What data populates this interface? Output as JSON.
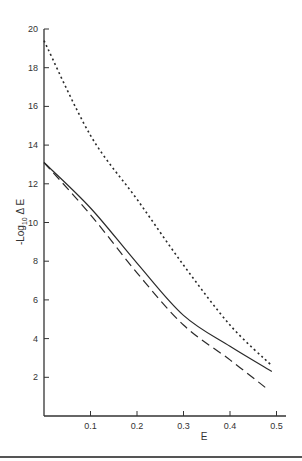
{
  "chart_data": {
    "type": "line",
    "title": "",
    "xlabel": "E",
    "ylabel": "-Log10 ΔE",
    "ylabel_parts": {
      "prefix": "-Log",
      "subscript": "10",
      "suffix": " Δ E"
    },
    "xlim": [
      0,
      0.5
    ],
    "ylim": [
      0,
      20
    ],
    "grid": false,
    "legend": null,
    "x_ticks": [
      0.1,
      0.2,
      0.3,
      0.4,
      0.5
    ],
    "x_tick_labels": [
      "0.1",
      "0.2",
      "0.3",
      "0.4",
      "0.5"
    ],
    "y_ticks": [
      2,
      4,
      6,
      8,
      10,
      12,
      14,
      16,
      18,
      20
    ],
    "y_tick_labels": [
      "2",
      "4",
      "6",
      "8",
      "10",
      "12",
      "14",
      "16",
      "18",
      "20"
    ],
    "series": [
      {
        "name": "dotted",
        "style": "dotted",
        "x": [
          0.0,
          0.1,
          0.2,
          0.3,
          0.4,
          0.49
        ],
        "values": [
          19.4,
          14.5,
          11.2,
          7.8,
          4.7,
          2.6
        ]
      },
      {
        "name": "solid",
        "style": "solid",
        "x": [
          0.0,
          0.1,
          0.2,
          0.3,
          0.4,
          0.49
        ],
        "values": [
          13.1,
          10.75,
          7.9,
          5.2,
          3.6,
          2.3
        ]
      },
      {
        "name": "dashed",
        "style": "dashed",
        "x": [
          0.0,
          0.1,
          0.2,
          0.3,
          0.4,
          0.48
        ],
        "values": [
          13.1,
          10.4,
          7.4,
          4.7,
          2.9,
          1.4
        ]
      }
    ]
  },
  "layout": {
    "x0_px": 44,
    "x_px_per_unit": 465,
    "y0_px": 416,
    "y_px_per_unit": 19.35,
    "x_axis_end_px": 286,
    "y_axis_top_px": 29,
    "line_color": "#2a2a2a"
  }
}
